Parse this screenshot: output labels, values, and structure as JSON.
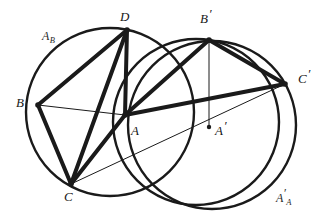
{
  "figure": {
    "type": "geometric-diagram",
    "width": 327,
    "height": 223,
    "background_color": "#ffffff",
    "stroke_color": "#1a1a1a"
  },
  "labels": {
    "region_left": {
      "base": "A",
      "sub": "B"
    },
    "region_right": {
      "base": "A",
      "prime": "′",
      "sub": "A"
    },
    "vertex_B": "B",
    "vertex_D": "D",
    "vertex_C": "C",
    "vertex_A": "A",
    "vertex_Bprime_base": "B",
    "vertex_Bprime_prime": "′",
    "vertex_Aprime_base": "A",
    "vertex_Aprime_prime": "′",
    "vertex_Cprime_base": "C",
    "vertex_Cprime_prime": "′"
  },
  "points": {
    "B": {
      "x": 38,
      "y": 105
    },
    "D": {
      "x": 127,
      "y": 30
    },
    "C": {
      "x": 71,
      "y": 184
    },
    "A": {
      "x": 125,
      "y": 115
    },
    "Bp": {
      "x": 209,
      "y": 40
    },
    "Ap": {
      "x": 209,
      "y": 127
    },
    "Cp": {
      "x": 285,
      "y": 84
    }
  },
  "circles": [
    {
      "name": "circle-left",
      "cx": 110,
      "cy": 112,
      "r": 84,
      "stroke_width": 2.4
    },
    {
      "name": "circle-middle",
      "cx": 196,
      "cy": 122,
      "r": 83,
      "stroke_width": 2.4
    },
    {
      "name": "circle-right",
      "cx": 212,
      "cy": 125,
      "r": 84,
      "stroke_width": 2.4
    }
  ],
  "segments": [
    {
      "name": "segment-B-D",
      "from": "B",
      "to": "D",
      "weight": "thick"
    },
    {
      "name": "segment-D-A",
      "from": "D",
      "to": "A",
      "weight": "thick"
    },
    {
      "name": "segment-D-C",
      "from": "D",
      "to": "C",
      "weight": "thick"
    },
    {
      "name": "segment-B-C",
      "from": "B",
      "to": "C",
      "weight": "thick"
    },
    {
      "name": "segment-C-A",
      "from": "C",
      "to": "A",
      "weight": "thick"
    },
    {
      "name": "segment-A-Bp",
      "from": "A",
      "to": "Bp",
      "weight": "thick"
    },
    {
      "name": "segment-Bp-Cp",
      "from": "Bp",
      "to": "Cp",
      "weight": "thick"
    },
    {
      "name": "segment-A-Cp",
      "from": "A",
      "to": "Cp",
      "weight": "thick"
    },
    {
      "name": "segment-B-A",
      "from": "B",
      "to": "A",
      "weight": "thin"
    },
    {
      "name": "segment-C-Cp",
      "from": "C",
      "to": "Cp",
      "weight": "thin"
    },
    {
      "name": "segment-Bp-Ap",
      "from": "Bp",
      "to": "Ap",
      "weight": "thin"
    }
  ],
  "label_positions": {
    "region_left": {
      "x": 42,
      "y": 30
    },
    "region_right": {
      "x": 276,
      "y": 192
    },
    "B": {
      "x": 16,
      "y": 96
    },
    "D": {
      "x": 120,
      "y": 10
    },
    "C": {
      "x": 64,
      "y": 190
    },
    "A": {
      "x": 131,
      "y": 124
    },
    "Bp": {
      "x": 200,
      "y": 12
    },
    "Ap": {
      "x": 215,
      "y": 124
    },
    "Cp": {
      "x": 298,
      "y": 72
    }
  },
  "stroke_widths": {
    "thick": 4.0,
    "thin": 1.0
  }
}
